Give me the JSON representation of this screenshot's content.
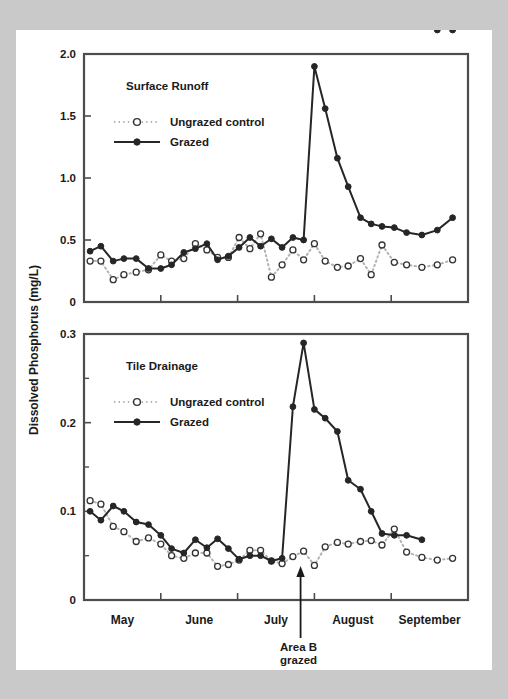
{
  "figure": {
    "y_axis_title": "Dissolved Phosphorus (mg/L)",
    "annotation": {
      "line1": "Area B",
      "line2": "grazed"
    },
    "colors": {
      "page_background": "#ffffff",
      "outer_background": "#c9c9c9",
      "axis": "#4d4d4d",
      "grazed_series": "#262626",
      "ungrazed_series": "#b3b3b3",
      "text": "#1a1a1a"
    }
  },
  "chart_data": [
    {
      "type": "line",
      "title": "Surface Runoff",
      "xlabel": "",
      "ylabel": "Dissolved Phosphorus (mg/L)",
      "ylim": [
        0,
        2.0
      ],
      "yticks": [
        0,
        0.5,
        1.0,
        1.5,
        2.0
      ],
      "ytick_labels": [
        "0",
        "0.5",
        "1.0",
        "1.5",
        "2.0"
      ],
      "xlim": [
        0,
        5
      ],
      "categories": [
        "May",
        "June",
        "July",
        "August",
        "September"
      ],
      "xtick_positions": [
        0,
        1,
        2,
        3,
        4,
        5
      ],
      "grid": false,
      "legend": [
        "Ungrazed control",
        "Grazed"
      ],
      "legend_position": "upper-left",
      "annotation_x": 2.82,
      "series": [
        {
          "name": "Ungrazed control",
          "style": "dotted-open-circle",
          "x": [
            0.08,
            0.22,
            0.38,
            0.52,
            0.68,
            0.84,
            1.0,
            1.14,
            1.3,
            1.45,
            1.6,
            1.74,
            1.88,
            2.02,
            2.16,
            2.3,
            2.44,
            2.58,
            2.72,
            2.86,
            3.0,
            3.14,
            3.3,
            3.44,
            3.6,
            3.74,
            3.88,
            4.04,
            4.2,
            4.4,
            4.6,
            4.8
          ],
          "values": [
            0.33,
            0.33,
            0.18,
            0.22,
            0.24,
            0.26,
            0.38,
            0.33,
            0.35,
            0.47,
            0.42,
            0.36,
            0.36,
            0.52,
            0.43,
            0.55,
            0.2,
            0.3,
            0.42,
            0.34,
            0.47,
            0.33,
            0.28,
            0.29,
            0.35,
            0.22,
            0.46,
            0.32,
            0.3,
            0.28,
            0.3,
            0.34
          ]
        },
        {
          "name": "Grazed",
          "style": "solid-filled-circle",
          "x": [
            0.08,
            0.22,
            0.38,
            0.52,
            0.68,
            0.84,
            1.0,
            1.14,
            1.3,
            1.45,
            1.6,
            1.74,
            1.88,
            2.02,
            2.16,
            2.3,
            2.44,
            2.58,
            2.72,
            2.86,
            3.0,
            3.14,
            3.3,
            3.44,
            3.6,
            3.74,
            3.88,
            4.04,
            4.2,
            4.4,
            4.6,
            4.8
          ],
          "values": [
            0.41,
            0.45,
            0.33,
            0.35,
            0.35,
            0.27,
            0.27,
            0.3,
            0.4,
            0.43,
            0.47,
            0.34,
            0.37,
            0.44,
            0.52,
            0.45,
            0.51,
            0.44,
            0.52,
            0.5,
            1.9,
            1.56,
            1.16,
            0.93,
            0.68,
            0.63,
            0.61,
            0.6,
            0.56,
            0.54,
            0.58,
            0.68
          ]
        }
      ]
    },
    {
      "type": "line",
      "title": "Tile Drainage",
      "xlabel": "",
      "ylabel": "Dissolved Phosphorus (mg/L)",
      "ylim": [
        0,
        0.3
      ],
      "yticks": [
        0,
        0.1,
        0.2,
        0.3
      ],
      "ytick_labels": [
        "0",
        "0.1",
        "0.2",
        "0.3"
      ],
      "yminorticks": [
        0.05,
        0.15,
        0.25
      ],
      "xlim": [
        0,
        5
      ],
      "categories": [
        "May",
        "June",
        "July",
        "August",
        "September"
      ],
      "xtick_positions": [
        0,
        1,
        2,
        3,
        4,
        5
      ],
      "grid": false,
      "legend": [
        "Ungrazed control",
        "Grazed"
      ],
      "legend_position": "upper-left",
      "annotation_x": 2.82,
      "series": [
        {
          "name": "Ungrazed control",
          "style": "dotted-open-circle",
          "x": [
            0.08,
            0.22,
            0.38,
            0.52,
            0.68,
            0.84,
            1.0,
            1.14,
            1.3,
            1.45,
            1.6,
            1.74,
            1.88,
            2.02,
            2.16,
            2.3,
            2.44,
            2.58,
            2.72,
            2.86,
            3.0,
            3.14,
            3.3,
            3.44,
            3.6,
            3.74,
            3.88,
            4.04,
            4.2,
            4.4,
            4.6,
            4.8
          ],
          "values": [
            0.112,
            0.108,
            0.083,
            0.077,
            0.066,
            0.07,
            0.063,
            0.05,
            0.047,
            0.053,
            0.053,
            0.038,
            0.04,
            0.045,
            0.056,
            0.056,
            0.044,
            0.041,
            0.049,
            0.055,
            0.039,
            0.06,
            0.065,
            0.063,
            0.066,
            0.067,
            0.062,
            0.08,
            0.054,
            0.048,
            0.045,
            0.047
          ]
        },
        {
          "name": "Grazed",
          "style": "solid-filled-circle",
          "x": [
            0.08,
            0.22,
            0.38,
            0.52,
            0.68,
            0.84,
            1.0,
            1.14,
            1.3,
            1.45,
            1.6,
            1.74,
            1.88,
            2.02,
            2.16,
            2.3,
            2.44,
            2.58,
            2.72,
            2.86,
            3.0,
            3.14,
            3.3,
            3.44,
            3.6,
            3.74,
            3.88,
            4.04,
            4.2,
            4.4,
            4.6,
            4.8
          ],
          "values": [
            0.1,
            0.09,
            0.106,
            0.1,
            0.088,
            0.085,
            0.073,
            0.058,
            0.053,
            0.068,
            0.059,
            0.069,
            0.058,
            0.046,
            0.05,
            0.05,
            0.044,
            0.047,
            0.218,
            0.29,
            0.215,
            0.205,
            0.19,
            0.135,
            0.125,
            0.1,
            0.075,
            0.073,
            0.073,
            0.068
          ]
        }
      ]
    }
  ]
}
